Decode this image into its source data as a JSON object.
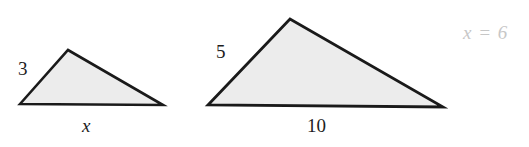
{
  "figure": {
    "background_color": "#ffffff",
    "stroke_color": "#1a1a1a",
    "fill_color": "#ececec",
    "label_color": "#1d1d1d",
    "answer_color": "#c7c7c7",
    "shapes": [
      {
        "name": "small-triangle",
        "points": "20,104 68,50 163,105",
        "labels": {
          "left_side": "3",
          "base": "x"
        }
      },
      {
        "name": "large-triangle",
        "points": "208,105 290,19 443,107",
        "labels": {
          "left_side": "5",
          "base": "10"
        }
      }
    ]
  },
  "labels": {
    "small_left_side": "3",
    "small_base": "x",
    "large_left_side": "5",
    "large_base": "10"
  },
  "answer": {
    "text": "x = 6"
  }
}
